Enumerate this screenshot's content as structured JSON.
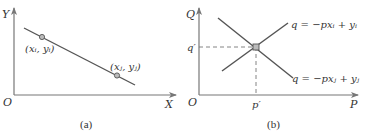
{
  "figure": {
    "panels": [
      {
        "id": "a",
        "caption": "(a)",
        "axes": {
          "x_label": "X",
          "y_label": "Y",
          "origin_label": "O"
        },
        "line": {
          "description": "decreasing straight line"
        },
        "points": [
          {
            "label": "(x_i, y_i)",
            "label_text": "(xᵢ, yᵢ)"
          },
          {
            "label": "(x_j, y_j)",
            "label_text": "(xⱼ, yⱼ)"
          }
        ]
      },
      {
        "id": "b",
        "caption": "(b)",
        "axes": {
          "x_label": "P",
          "y_label": "Q",
          "origin_label": "O"
        },
        "lines": [
          {
            "equation": "q = −pxᵢ + yᵢ",
            "direction": "increasing"
          },
          {
            "equation": "q = −pxⱼ + yⱼ",
            "direction": "decreasing"
          }
        ],
        "intersection": {
          "x_label": "p′",
          "y_label": "q′"
        }
      }
    ],
    "colors": {
      "axis": "#777777",
      "line": "#555555",
      "point_fill": "#bbbbbb",
      "text": "#333333"
    }
  }
}
